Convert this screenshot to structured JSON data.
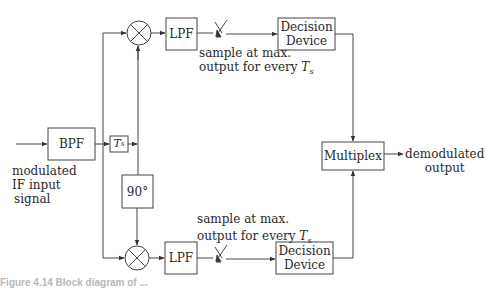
{
  "diagram": {
    "title": "",
    "blocks": {
      "bpf": "BPF",
      "delay": "T",
      "delay_sub": "s",
      "phase_shift": "90°",
      "lpf_top": "LPF",
      "lpf_bottom": "LPF",
      "decision_top_line1": "Decision",
      "decision_top_line2": "Device",
      "decision_bottom_line1": "Decision",
      "decision_bottom_line2": "Device",
      "multiplex": "Multiplex"
    },
    "labels": {
      "input_line1": "modulated",
      "input_line2": "IF input",
      "input_line3": "signal",
      "sample_top_line1": "sample at max.",
      "sample_top_line2": "output for every ",
      "sample_top_var": "T",
      "sample_top_sub": "s",
      "sample_bottom_line1": "sample at max.",
      "sample_bottom_line2": "output for every ",
      "sample_bottom_var": "T",
      "sample_bottom_sub": "s",
      "output_line1": "demodulated",
      "output_line2": "output"
    },
    "caption": "Figure 4.14  Block diagram of ..."
  },
  "colors": {
    "line": "#3a3a3a",
    "text": "#2a2a2a",
    "background": "#ffffff"
  }
}
